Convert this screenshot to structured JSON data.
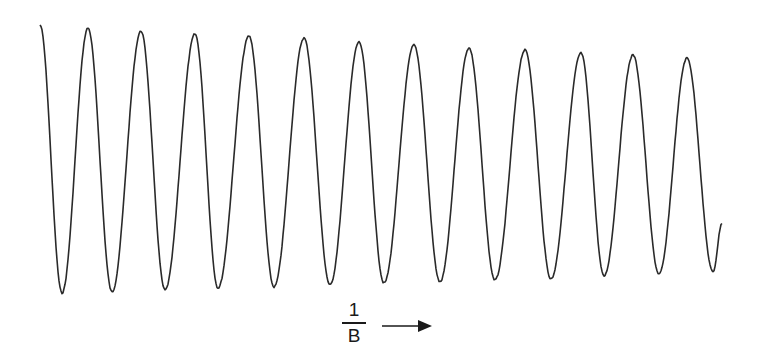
{
  "chart_data": {
    "type": "line",
    "title": "",
    "xlabel": "1/B",
    "xlabel_numerator": "1",
    "xlabel_denominator": "B",
    "x_direction": "increasing to the right (arrow)",
    "ylabel": "",
    "grid": false,
    "legend": null,
    "num_peaks": 12,
    "num_troughs": 13,
    "series": [
      {
        "name": "signal",
        "color": "#2a2a2a",
        "extrema_px": [
          [
            40,
            25
          ],
          [
            62,
            293
          ],
          [
            88,
            28
          ],
          [
            112,
            292
          ],
          [
            141,
            31
          ],
          [
            165,
            290
          ],
          [
            195,
            34
          ],
          [
            218,
            288
          ],
          [
            249,
            36
          ],
          [
            274,
            287
          ],
          [
            304,
            38
          ],
          [
            330,
            285
          ],
          [
            359,
            42
          ],
          [
            384,
            283
          ],
          [
            414,
            45
          ],
          [
            440,
            282
          ],
          [
            469,
            48
          ],
          [
            495,
            280
          ],
          [
            525,
            50
          ],
          [
            551,
            279
          ],
          [
            581,
            53
          ],
          [
            604,
            276
          ],
          [
            633,
            55
          ],
          [
            659,
            274
          ],
          [
            687,
            58
          ],
          [
            713,
            272
          ],
          [
            722,
            223
          ]
        ]
      }
    ]
  },
  "labels": {
    "x_numerator": "1",
    "x_denominator": "B"
  },
  "colors": {
    "line": "#2a2a2a",
    "background": "#ffffff"
  }
}
